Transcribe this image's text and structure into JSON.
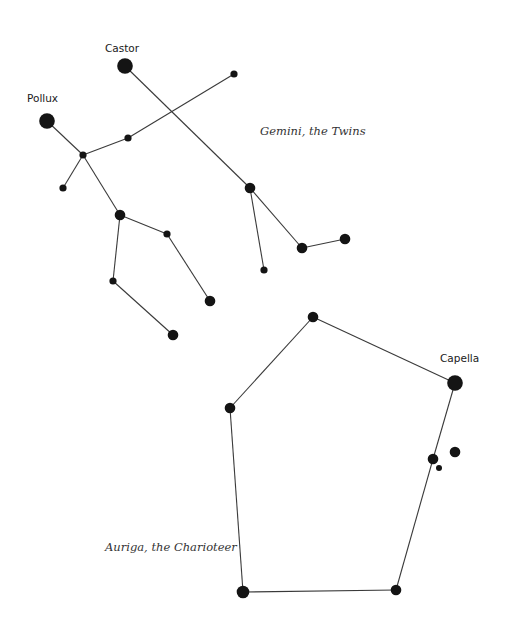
{
  "constellations": [
    {
      "id": "gemini",
      "name": "Gemini, the Twins",
      "stars": [
        {
          "id": "castor",
          "name": "Castor",
          "magnitude_class": "bright"
        },
        {
          "id": "g1",
          "name": "",
          "magnitude_class": "faint"
        },
        {
          "id": "g2",
          "name": "",
          "magnitude_class": "medium"
        },
        {
          "id": "g3",
          "name": "",
          "magnitude_class": "medium"
        },
        {
          "id": "g4",
          "name": "",
          "magnitude_class": "medium"
        },
        {
          "id": "g5",
          "name": "",
          "magnitude_class": "faint"
        },
        {
          "id": "pollux",
          "name": "Pollux",
          "magnitude_class": "bright"
        },
        {
          "id": "g6",
          "name": "",
          "magnitude_class": "faint"
        },
        {
          "id": "g7",
          "name": "",
          "magnitude_class": "faint"
        },
        {
          "id": "g8",
          "name": "",
          "magnitude_class": "faint"
        },
        {
          "id": "g9",
          "name": "",
          "magnitude_class": "medium"
        },
        {
          "id": "g10",
          "name": "",
          "magnitude_class": "faint"
        },
        {
          "id": "g11",
          "name": "",
          "magnitude_class": "faint"
        },
        {
          "id": "g12",
          "name": "",
          "magnitude_class": "medium"
        },
        {
          "id": "g13",
          "name": "",
          "magnitude_class": "medium"
        }
      ],
      "edges": [
        [
          "castor",
          "g2"
        ],
        [
          "g2",
          "g3"
        ],
        [
          "g3",
          "g4"
        ],
        [
          "g2",
          "g5"
        ],
        [
          "g1",
          "g6"
        ],
        [
          "g6",
          "g7"
        ],
        [
          "pollux",
          "g7"
        ],
        [
          "g7",
          "g8"
        ],
        [
          "g7",
          "g9"
        ],
        [
          "g9",
          "g10"
        ],
        [
          "g10",
          "g12"
        ],
        [
          "g9",
          "g11"
        ],
        [
          "g11",
          "g13"
        ]
      ]
    },
    {
      "id": "auriga",
      "name": "Auriga, the Charioteer",
      "stars": [
        {
          "id": "a1",
          "name": "",
          "magnitude_class": "medium"
        },
        {
          "id": "capella",
          "name": "Capella",
          "magnitude_class": "bright"
        },
        {
          "id": "a2",
          "name": "",
          "magnitude_class": "medium"
        },
        {
          "id": "a3",
          "name": "",
          "magnitude_class": "medium"
        },
        {
          "id": "a4",
          "name": "",
          "magnitude_class": "faint"
        },
        {
          "id": "a5",
          "name": "",
          "magnitude_class": "medium"
        },
        {
          "id": "a6",
          "name": "",
          "magnitude_class": "medium"
        },
        {
          "id": "a7",
          "name": "",
          "magnitude_class": "medium"
        }
      ],
      "edges": [
        [
          "a7",
          "a1"
        ],
        [
          "a1",
          "capella"
        ],
        [
          "capella",
          "a2"
        ],
        [
          "a2",
          "a5"
        ],
        [
          "a5",
          "a6"
        ],
        [
          "a6",
          "a7"
        ]
      ]
    }
  ]
}
